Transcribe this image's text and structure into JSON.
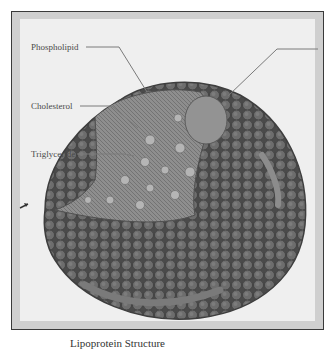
{
  "figure": {
    "labels": [
      {
        "id": "phospholipid",
        "text": "Phospholipid"
      },
      {
        "id": "cholesterol",
        "text": "Cholesterol"
      },
      {
        "id": "triglyceride",
        "text": "Triglyceride"
      },
      {
        "id": "apolipoprotein",
        "text": ""
      }
    ],
    "caption": "Lipoprotein Structure",
    "colors": {
      "frame": "#cfcfcf",
      "panel": "#efefef",
      "shell": "#6e6e6e",
      "sphere_outline": "#3e3e3e",
      "core": "#8a8a8a",
      "protein": "#9a9a9a",
      "leader_line": "#7a7a7a"
    }
  }
}
